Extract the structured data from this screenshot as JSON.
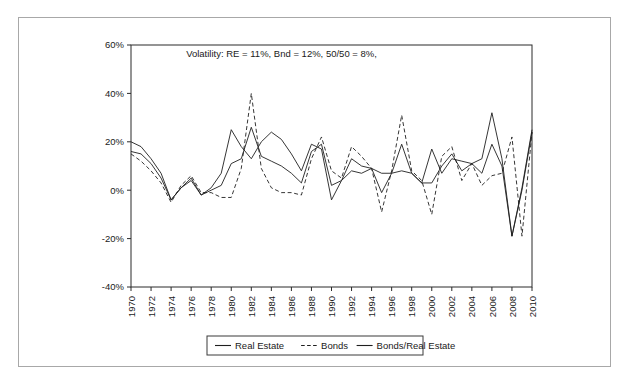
{
  "figure": {
    "background": "#ffffff",
    "frame_color": "#a8a8a8"
  },
  "chart_data": {
    "type": "line",
    "title": "Volatility: RE = 11%, Bnd = 12%, 50/50 = 8%,",
    "xlabel": "",
    "ylabel": "",
    "grid": false,
    "legend_position": "bottom",
    "xlim": [
      1970,
      2010
    ],
    "ylim": [
      -40,
      60
    ],
    "ytick_labels": [
      "60%",
      "40%",
      "20%",
      "0%",
      "-20%",
      "-40%"
    ],
    "ytick_values": [
      60,
      40,
      20,
      0,
      -20,
      -40
    ],
    "xtick_labels": [
      "1970",
      "1972",
      "1974",
      "1976",
      "1978",
      "1980",
      "1982",
      "1984",
      "1986",
      "1988",
      "1990",
      "1992",
      "1994",
      "1996",
      "1998",
      "2000",
      "2002",
      "2004",
      "2006",
      "2008",
      "2010"
    ],
    "xtick_values": [
      1970,
      1972,
      1974,
      1976,
      1978,
      1980,
      1982,
      1984,
      1986,
      1988,
      1990,
      1992,
      1994,
      1996,
      1998,
      2000,
      2002,
      2004,
      2006,
      2008,
      2010
    ],
    "x": [
      1970,
      1971,
      1972,
      1973,
      1974,
      1975,
      1976,
      1977,
      1978,
      1979,
      1980,
      1981,
      1982,
      1983,
      1984,
      1985,
      1986,
      1987,
      1988,
      1989,
      1990,
      1991,
      1992,
      1993,
      1994,
      1995,
      1996,
      1997,
      1998,
      1999,
      2000,
      2001,
      2002,
      2003,
      2004,
      2005,
      2006,
      2007,
      2008,
      2009,
      2010
    ],
    "series": [
      {
        "name": "Real Estate",
        "style": "solid",
        "color": "#1f1f1f",
        "values": [
          20,
          18,
          13,
          7,
          -4,
          1,
          4,
          -2,
          1,
          7,
          25,
          18,
          13,
          20,
          24,
          21,
          15,
          8,
          19,
          17,
          -4,
          4,
          8,
          7,
          9,
          7,
          7,
          8,
          7,
          3,
          17,
          7,
          13,
          12,
          11,
          13,
          32,
          13,
          -19,
          1,
          25
        ]
      },
      {
        "name": "Bonds",
        "style": "dashed",
        "color": "#1f1f1f",
        "values": [
          15,
          12,
          8,
          3,
          -5,
          2,
          6,
          -1,
          -1,
          -3,
          -3,
          9,
          40,
          9,
          1,
          -1,
          -1,
          -2,
          13,
          22,
          8,
          5,
          18,
          14,
          9,
          -9,
          8,
          31,
          8,
          4,
          -10,
          14,
          18,
          4,
          11,
          2,
          6,
          7,
          22,
          -19,
          24
        ]
      },
      {
        "name": "Bonds/Real Estate",
        "style": "solid",
        "color": "#1f1f1f",
        "values": [
          16,
          15,
          11,
          5,
          -4,
          1,
          5,
          -2,
          0,
          2,
          11,
          13,
          26,
          14,
          12,
          10,
          7,
          3,
          16,
          19,
          2,
          4,
          13,
          10,
          9,
          -1,
          7,
          19,
          7,
          3,
          3,
          10,
          15,
          8,
          11,
          7,
          19,
          10,
          -19,
          0,
          24
        ]
      }
    ]
  },
  "legend": {
    "items": [
      {
        "label": "Real Estate",
        "style": "solid"
      },
      {
        "label": "Bonds",
        "style": "dashed"
      },
      {
        "label": "Bonds/Real Estate",
        "style": "solid"
      }
    ]
  }
}
